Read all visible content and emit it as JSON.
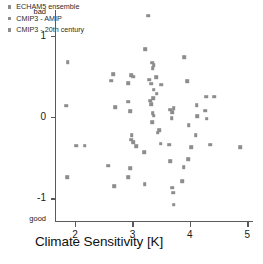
{
  "chart_data": {
    "type": "scatter",
    "title": "",
    "xlabel": "Climate Sensitivity [K]",
    "ylabel": "Normalized Aggregated RMS",
    "xlim": [
      1.65,
      5.1
    ],
    "ylim": [
      -1.28,
      1.32
    ],
    "xticks": [
      2,
      3,
      4,
      5
    ],
    "xticklabels": [
      "2",
      "3",
      "4",
      "5"
    ],
    "yticks": [
      1,
      0,
      -1
    ],
    "yticklabels": [
      "1",
      "0",
      "-1"
    ],
    "y_axis_top_label": "bad",
    "y_axis_bottom_label": "good",
    "grid": false,
    "legend_position": "upper-left",
    "marker_color": "#8d8d8d",
    "axis_color": "#5a5a5a",
    "legend": [
      "ECHAM5 ensemble",
      "CMIP3 - AMIP",
      "CMIP3 - 20th century"
    ],
    "series": [
      {
        "name": "all models",
        "points": [
          [
            3.27,
            1.25
          ],
          [
            3.22,
            0.84
          ],
          [
            3.9,
            0.74
          ],
          [
            1.87,
            0.68
          ],
          [
            3.34,
            0.67
          ],
          [
            3.37,
            0.64
          ],
          [
            3.35,
            0.6
          ],
          [
            2.66,
            0.53
          ],
          [
            2.98,
            0.52
          ],
          [
            3.01,
            0.5
          ],
          [
            3.41,
            0.49
          ],
          [
            3.29,
            0.46
          ],
          [
            2.63,
            0.45
          ],
          [
            3.95,
            0.44
          ],
          [
            2.93,
            0.42
          ],
          [
            3.33,
            0.41
          ],
          [
            3.5,
            0.4
          ],
          [
            3.37,
            0.34
          ],
          [
            3.42,
            0.29
          ],
          [
            4.28,
            0.25
          ],
          [
            4.42,
            0.25
          ],
          [
            3.36,
            0.23
          ],
          [
            3.31,
            0.2
          ],
          [
            2.93,
            0.19
          ],
          [
            3.33,
            0.16
          ],
          [
            4.12,
            0.15
          ],
          [
            1.85,
            0.14
          ],
          [
            2.7,
            0.12
          ],
          [
            3.72,
            0.11
          ],
          [
            3.66,
            0.09
          ],
          [
            4.27,
            0.08
          ],
          [
            2.96,
            0.07
          ],
          [
            3.69,
            0.06
          ],
          [
            3.35,
            0.05
          ],
          [
            3.37,
            0.02
          ],
          [
            4.13,
            0.01
          ],
          [
            3.68,
            -0.01
          ],
          [
            4.29,
            -0.02
          ],
          [
            3.34,
            -0.06
          ],
          [
            3.98,
            -0.1
          ],
          [
            3.47,
            -0.16
          ],
          [
            3.44,
            -0.19
          ],
          [
            2.99,
            -0.22
          ],
          [
            4.1,
            -0.22
          ],
          [
            2.98,
            -0.28
          ],
          [
            3.01,
            -0.31
          ],
          [
            3.49,
            -0.33
          ],
          [
            4.35,
            -0.34
          ],
          [
            3.64,
            -0.34
          ],
          [
            2.02,
            -0.35
          ],
          [
            2.17,
            -0.35
          ],
          [
            3.06,
            -0.36
          ],
          [
            4.02,
            -0.37
          ],
          [
            4.88,
            -0.37
          ],
          [
            3.2,
            -0.43
          ],
          [
            3.97,
            -0.52
          ],
          [
            3.66,
            -0.54
          ],
          [
            2.58,
            -0.6
          ],
          [
            3.89,
            -0.62
          ],
          [
            2.96,
            -0.63
          ],
          [
            2.93,
            -0.74
          ],
          [
            1.86,
            -0.74
          ],
          [
            3.87,
            -0.79
          ],
          [
            3.21,
            -0.83
          ],
          [
            2.68,
            -0.85
          ],
          [
            3.69,
            -0.87
          ],
          [
            3.71,
            -0.93
          ],
          [
            3.72,
            -1.08
          ]
        ]
      }
    ]
  }
}
